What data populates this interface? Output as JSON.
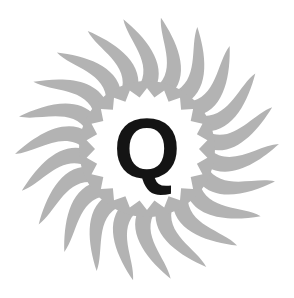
{
  "logo": {
    "letter": "Q",
    "letter_color": "#141414",
    "ray_color": "#b3b3b3",
    "background": "#ffffff",
    "center": [
      147,
      149
    ],
    "ray_count": 22,
    "ray_outer_radius": 132,
    "ray_inner_radius": 62,
    "core_radius": 52,
    "core_spikes": 22
  }
}
